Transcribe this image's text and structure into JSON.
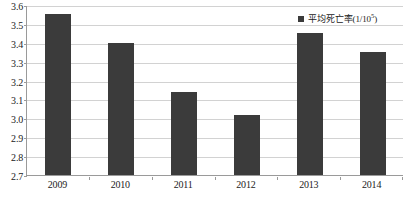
{
  "chart_data": {
    "type": "bar",
    "title": "",
    "xlabel": "",
    "ylabel": "",
    "categories": [
      "2009",
      "2010",
      "2011",
      "2012",
      "2013",
      "2014"
    ],
    "values": [
      3.55,
      3.4,
      3.14,
      3.02,
      3.45,
      3.35
    ],
    "series": [
      {
        "name": "平均死亡率(1/10⁵)",
        "values": [
          3.55,
          3.4,
          3.14,
          3.02,
          3.45,
          3.35
        ]
      }
    ],
    "ylim": [
      2.7,
      3.6
    ],
    "ytick_step": 0.1,
    "yticks": [
      "3.6",
      "3.5",
      "3.4",
      "3.3",
      "3.2",
      "3.1",
      "3.0",
      "2.9",
      "2.8",
      "2.7"
    ],
    "ytick_values": [
      3.6,
      3.5,
      3.4,
      3.3,
      3.2,
      3.1,
      3.0,
      2.9,
      2.8,
      2.7
    ],
    "grid": true,
    "legend_position": "top-right",
    "bar_color": "#3b3b3b",
    "gridline_color": "#d2d2d2",
    "axis_color": "#9a9a9a"
  },
  "legend": {
    "marker_name": "legend-color-swatch",
    "label_main": "平均死亡率(1/10",
    "label_sup": "5",
    "label_tail": ")"
  }
}
